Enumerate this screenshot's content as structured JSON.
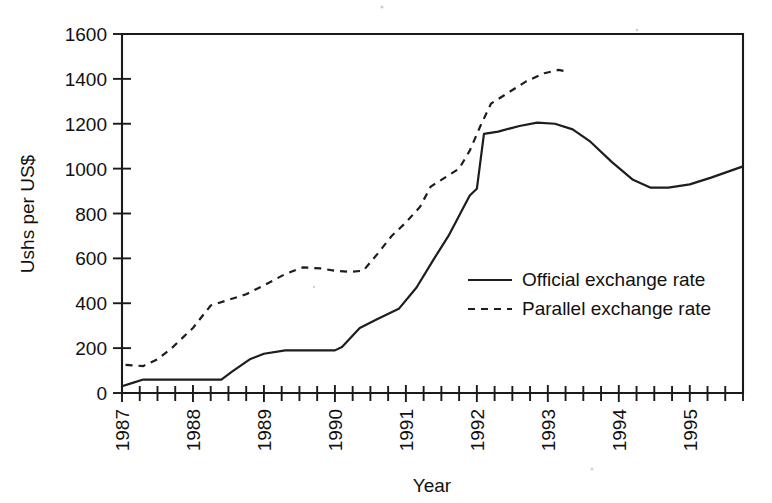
{
  "chart_data": {
    "type": "line",
    "title": "",
    "xlabel": "Year",
    "ylabel": "Ushs per US$",
    "xlim": [
      1987.0,
      1995.75
    ],
    "ylim": [
      0,
      1600
    ],
    "y_ticks": [
      0,
      200,
      400,
      600,
      800,
      1000,
      1200,
      1400,
      1600
    ],
    "x_ticks": [
      1987,
      1988,
      1989,
      1990,
      1991,
      1992,
      1993,
      1994,
      1995
    ],
    "x_minor_step": 0.25,
    "grid": false,
    "legend_position": "center-right",
    "series": [
      {
        "name": "Official exchange rate",
        "style": "solid",
        "color": "#1d1d1d",
        "x": [
          1987.0,
          1987.15,
          1987.3,
          1987.6,
          1988.0,
          1988.4,
          1988.55,
          1988.8,
          1989.0,
          1989.3,
          1989.6,
          1990.0,
          1990.1,
          1990.35,
          1990.6,
          1990.9,
          1991.15,
          1991.4,
          1991.6,
          1991.75,
          1991.9,
          1992.0,
          1992.1,
          1992.3,
          1992.6,
          1992.85,
          1993.1,
          1993.35,
          1993.6,
          1993.9,
          1994.2,
          1994.45,
          1994.7,
          1995.0,
          1995.3,
          1995.75
        ],
        "y": [
          30,
          45,
          60,
          60,
          60,
          60,
          95,
          150,
          175,
          190,
          190,
          190,
          205,
          290,
          330,
          375,
          470,
          600,
          700,
          790,
          880,
          910,
          1155,
          1165,
          1190,
          1205,
          1200,
          1175,
          1120,
          1030,
          950,
          915,
          915,
          930,
          960,
          1010
        ]
      },
      {
        "name": "Parallel exchange rate",
        "style": "dashed",
        "color": "#1d1d1d",
        "x": [
          1987.05,
          1987.3,
          1987.5,
          1987.7,
          1988.0,
          1988.25,
          1988.5,
          1988.75,
          1989.0,
          1989.3,
          1989.55,
          1989.8,
          1990.0,
          1990.2,
          1990.4,
          1990.6,
          1990.8,
          1991.0,
          1991.2,
          1991.35,
          1991.55,
          1991.75,
          1991.9,
          1992.05,
          1992.2,
          1992.45,
          1992.7,
          1992.95,
          1993.15,
          1993.3
        ],
        "y": [
          125,
          120,
          150,
          200,
          290,
          390,
          415,
          440,
          480,
          530,
          560,
          555,
          545,
          540,
          545,
          620,
          700,
          760,
          830,
          920,
          960,
          1000,
          1080,
          1190,
          1290,
          1340,
          1390,
          1425,
          1440,
          1430
        ]
      }
    ]
  },
  "legend": {
    "items": [
      {
        "label": "Official exchange rate",
        "style": "solid"
      },
      {
        "label": "Parallel exchange rate",
        "style": "dashed"
      }
    ]
  }
}
